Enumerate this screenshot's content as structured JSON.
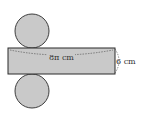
{
  "diagram": {
    "type": "cylinder-net",
    "length_label": "8π cm",
    "height_label": "6 cm",
    "fill_color": "#c9c9c9",
    "stroke_color": "#2a2a2a"
  }
}
